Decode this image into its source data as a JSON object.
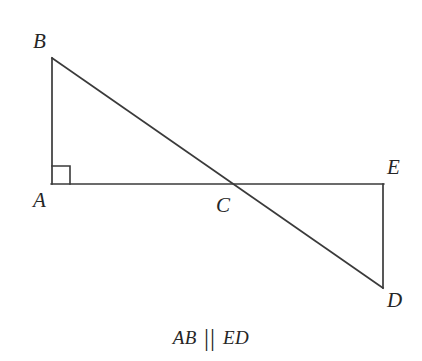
{
  "figure": {
    "background_color": "#ffffff",
    "stroke_color": "#3a3a3a",
    "stroke_width": 1.6
  },
  "points": {
    "A": {
      "label": "A",
      "x": 52,
      "y": 184
    },
    "B": {
      "label": "B",
      "x": 52,
      "y": 58
    },
    "C": {
      "label": "C",
      "x": 231,
      "y": 184
    },
    "D": {
      "label": "D",
      "x": 383,
      "y": 288
    },
    "E": {
      "label": "E",
      "x": 383,
      "y": 184
    }
  },
  "segments": [
    {
      "name": "segment-AB",
      "from": "A",
      "to": "B"
    },
    {
      "name": "segment-AE",
      "from": "A",
      "to": "E"
    },
    {
      "name": "segment-BD",
      "from": "B",
      "to": "D"
    },
    {
      "name": "segment-ED",
      "from": "E",
      "to": "D"
    }
  ],
  "markers": {
    "right_angle": {
      "name": "right-angle-marker-at-A",
      "at_vertex": "A",
      "size": 18
    }
  },
  "caption": {
    "left_term": "AB",
    "parallel_symbol": "||",
    "right_term": "ED",
    "full_text": "AB || ED"
  }
}
